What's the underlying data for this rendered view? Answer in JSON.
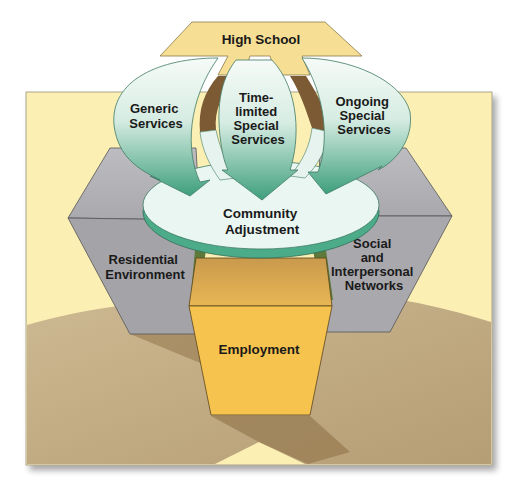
{
  "diagram": {
    "type": "conceptual-model",
    "nodes": {
      "high_school": {
        "label": "High School"
      },
      "generic_services": {
        "lines": [
          "Generic",
          "Services"
        ]
      },
      "time_limited": {
        "lines": [
          "Time-",
          "limited",
          "Special",
          "Services"
        ]
      },
      "ongoing": {
        "lines": [
          "Ongoing",
          "Special",
          "Services"
        ]
      },
      "community": {
        "lines": [
          "Community",
          "Adjustment"
        ]
      },
      "residential": {
        "lines": [
          "Residential",
          "Environment"
        ]
      },
      "social": {
        "lines": [
          "Social",
          "and",
          "Interpersonal",
          "Networks"
        ]
      },
      "employment": {
        "label": "Employment"
      }
    },
    "edges": [
      {
        "from": "High School",
        "to": "Generic Services"
      },
      {
        "from": "High School",
        "to": "Time-limited Special Services"
      },
      {
        "from": "High School",
        "to": "Ongoing Special Services"
      },
      {
        "from": "Generic Services",
        "to": "Community Adjustment"
      },
      {
        "from": "Time-limited Special Services",
        "to": "Community Adjustment"
      },
      {
        "from": "Ongoing Special Services",
        "to": "Community Adjustment"
      }
    ],
    "supports": [
      "Residential Environment",
      "Employment",
      "Social and Interpersonal Networks"
    ]
  },
  "colors": {
    "panel_bg": "#fbefb4",
    "ground": "#c6b08a",
    "ground_shadow": "#9c8157",
    "high_school": "#f6df94",
    "arrow_top": "#f4faf6",
    "arrow_bottom": "#3fa17f",
    "disk_top": "#e9f6f1",
    "disk_edge": "#4cab88",
    "gray_light": "#b5b4b8",
    "gray_dark": "#a09fa4",
    "employment": "#f6c34e",
    "employment_top": "#d9a94a",
    "brown_gap": "#7b5a34",
    "green_leg": "#5d7a3a"
  }
}
